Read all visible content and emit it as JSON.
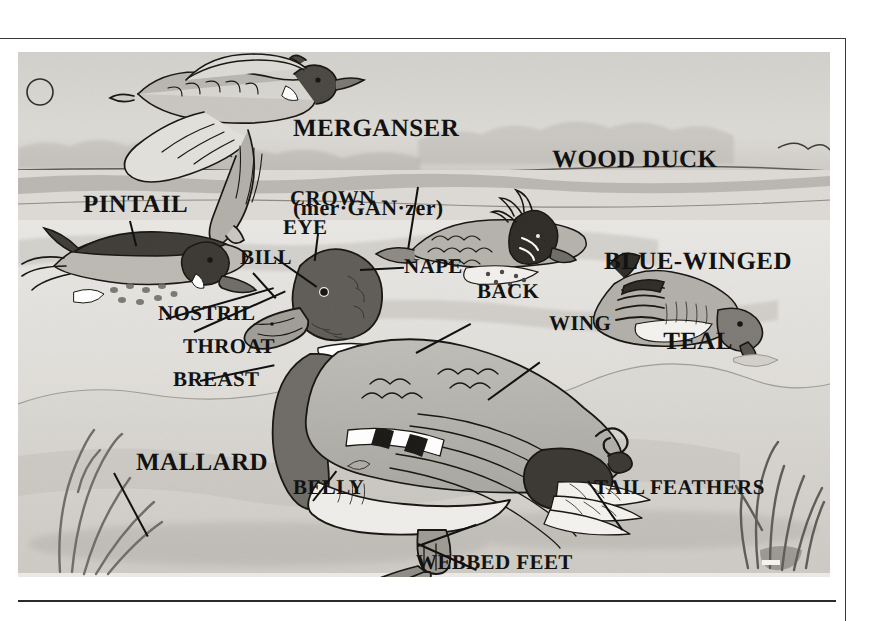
{
  "plate": {
    "title_species": [
      {
        "name": "merganser",
        "line1": "MERGANSER",
        "line2": "(mer·GAN·zer)"
      },
      {
        "name": "pintail",
        "label": "PINTAIL"
      },
      {
        "name": "wood-duck",
        "label": "WOOD DUCK"
      },
      {
        "name": "blue-winged-teal",
        "line1": "BLUE-WINGED",
        "line2": "TEAL"
      },
      {
        "name": "mallard",
        "label": "MALLARD"
      }
    ],
    "part_labels": [
      {
        "name": "crown",
        "label": "CROWN"
      },
      {
        "name": "eye",
        "label": "EYE"
      },
      {
        "name": "bill",
        "label": "BILL"
      },
      {
        "name": "nape",
        "label": "NAPE"
      },
      {
        "name": "nostril",
        "label": "NOSTRIL"
      },
      {
        "name": "throat",
        "label": "THROAT"
      },
      {
        "name": "breast",
        "label": "BREAST"
      },
      {
        "name": "back",
        "label": "BACK"
      },
      {
        "name": "wing",
        "label": "WING"
      },
      {
        "name": "belly",
        "label": "BELLY"
      },
      {
        "name": "tail-feathers",
        "label": "TAIL FEATHERS"
      },
      {
        "name": "webbed-feet",
        "label": "WEBBED FEET"
      }
    ],
    "scene": {
      "sky_color": "#d6d4cf",
      "water_color": "#e4e2de",
      "shore_color": "#dcd9d3",
      "ink_color": "#1c1c1c",
      "paper_color": "#eeece8",
      "moon_label": "moon"
    }
  }
}
